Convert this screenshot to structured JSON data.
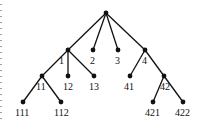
{
  "diagram": {
    "type": "tree",
    "colors": {
      "ink": "#111111",
      "background": "#ffffff"
    },
    "nodes": [
      {
        "id": "root",
        "label": "",
        "x": 106,
        "y": 13,
        "lx": 0,
        "ly": 0
      },
      {
        "id": "n1",
        "label": "1",
        "x": 68,
        "y": 50,
        "lx": 59,
        "ly": 64
      },
      {
        "id": "n2",
        "label": "2",
        "x": 93,
        "y": 50,
        "lx": 90,
        "ly": 64
      },
      {
        "id": "n3",
        "label": "3",
        "x": 118,
        "y": 50,
        "lx": 115,
        "ly": 64
      },
      {
        "id": "n4",
        "label": "4",
        "x": 145,
        "y": 50,
        "lx": 142,
        "ly": 64
      },
      {
        "id": "n11",
        "label": "11",
        "x": 42,
        "y": 76,
        "lx": 36,
        "ly": 90
      },
      {
        "id": "n12",
        "label": "12",
        "x": 68,
        "y": 76,
        "lx": 63,
        "ly": 90
      },
      {
        "id": "n13",
        "label": "13",
        "x": 94,
        "y": 76,
        "lx": 89,
        "ly": 90
      },
      {
        "id": "n41",
        "label": "41",
        "x": 130,
        "y": 76,
        "lx": 124,
        "ly": 90
      },
      {
        "id": "n42",
        "label": "42",
        "x": 164,
        "y": 76,
        "lx": 160,
        "ly": 90
      },
      {
        "id": "n111",
        "label": "111",
        "x": 23,
        "y": 102,
        "lx": 15,
        "ly": 116
      },
      {
        "id": "n112",
        "label": "112",
        "x": 61,
        "y": 102,
        "lx": 54,
        "ly": 116
      },
      {
        "id": "n421",
        "label": "421",
        "x": 153,
        "y": 102,
        "lx": 145,
        "ly": 116
      },
      {
        "id": "n422",
        "label": "422",
        "x": 183,
        "y": 102,
        "lx": 175,
        "ly": 116
      }
    ],
    "edges": [
      [
        "root",
        "n1"
      ],
      [
        "root",
        "n2"
      ],
      [
        "root",
        "n3"
      ],
      [
        "root",
        "n4"
      ],
      [
        "n1",
        "n11"
      ],
      [
        "n1",
        "n12"
      ],
      [
        "n1",
        "n13"
      ],
      [
        "n4",
        "n41"
      ],
      [
        "n4",
        "n42"
      ],
      [
        "n11",
        "n111"
      ],
      [
        "n11",
        "n112"
      ],
      [
        "n42",
        "n421"
      ],
      [
        "n42",
        "n422"
      ]
    ]
  }
}
